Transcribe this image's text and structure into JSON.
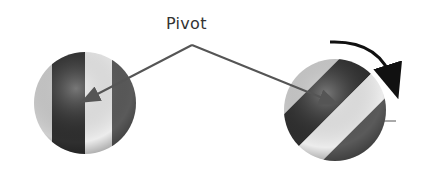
{
  "diagram": {
    "label": "Pivot",
    "colors": {
      "text": "#333333",
      "arrow": "#555555",
      "dark_stripe": "#2a2a2a",
      "light_stripe": "#e8e8e8",
      "mid_stripe": "#6e6e6e"
    },
    "objects": [
      {
        "name": "ball-upright",
        "cx": 85,
        "cy": 103,
        "r": 51
      },
      {
        "name": "ball-rotated",
        "cx": 335,
        "cy": 110,
        "r": 51,
        "rotation_deg": 45
      }
    ]
  }
}
